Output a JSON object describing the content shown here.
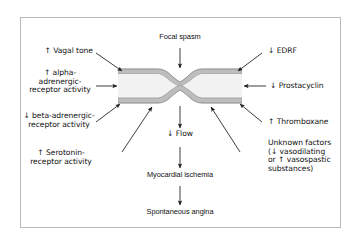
{
  "figure": {
    "border_color": "#b9b9b9",
    "background": "#ffffff",
    "text_color": "#111111"
  },
  "vessel": {
    "name": "coronary-artery-segment",
    "wall_color": "#bdbdbd",
    "wall_stroke": "#8f8f8f",
    "lumen_color": "#f2f2f2",
    "description": "longitudinal artery with focal narrowing (stenosis) at center"
  },
  "center_chain": {
    "top_label": "Focal spasm",
    "flow_label": "↓ Flow",
    "ischemia_label": "Myocardial ischemia",
    "angina_label": "Spontaneous angina"
  },
  "left_factors": [
    {
      "id": "vagal-tone",
      "text": "↑ Vagal tone"
    },
    {
      "id": "alpha-adrenergic",
      "text": "↑ alpha-\nadrenergic-\nreceptor activity"
    },
    {
      "id": "beta-adrenergic",
      "text": "↓ beta-adrenergic-\nreceptor activity"
    },
    {
      "id": "serotonin",
      "text": "↑ Serotonin-\nreceptor activity"
    }
  ],
  "right_factors": [
    {
      "id": "edrf",
      "text": "↓ EDRF"
    },
    {
      "id": "prostacyclin",
      "text": "↓ Prostacyclin"
    },
    {
      "id": "thromboxane",
      "text": "↑ Thromboxane"
    },
    {
      "id": "unknown-factors",
      "text": "Unknown factors\n(↓ vasodilating\nor ↑ vasospastic\nsubstances)"
    }
  ]
}
